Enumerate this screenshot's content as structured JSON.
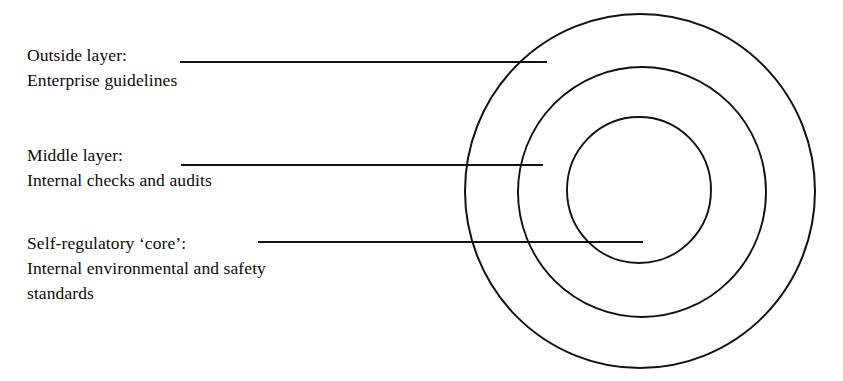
{
  "diagram": {
    "background_color": "#ffffff",
    "stroke_color": "#111111",
    "center": {
      "x": 640,
      "y": 191
    },
    "rings": [
      {
        "name": "outer-ring",
        "radius_x": 175,
        "radius_y": 177,
        "stroke_width": 2.0,
        "layer_label": "Outside layer"
      },
      {
        "name": "middle-ring",
        "radius_x": 124,
        "radius_y": 125,
        "stroke_width": 1.9,
        "layer_label": "Middle layer"
      },
      {
        "name": "inner-ring",
        "radius_x": 72,
        "radius_y": 73,
        "stroke_width": 1.9,
        "layer_label": "Self-regulatory core"
      }
    ],
    "leaders": [
      {
        "name": "leader-outer",
        "x1": 180,
        "y1": 62,
        "x2": 547,
        "y2": 62,
        "stroke_width": 2.0
      },
      {
        "name": "leader-middle",
        "x1": 181,
        "y1": 165,
        "x2": 543,
        "y2": 165,
        "stroke_width": 2.0
      },
      {
        "name": "leader-core",
        "x1": 258,
        "y1": 242,
        "x2": 643,
        "y2": 242,
        "stroke_width": 2.0
      }
    ],
    "callouts": {
      "outer": {
        "line1": "Outside layer:",
        "line2": "Enterprise guidelines"
      },
      "middle": {
        "line1": "Middle layer:",
        "line2": "Internal checks and audits"
      },
      "core": {
        "line1": "Self-regulatory ‘core’:",
        "line2": "Internal environmental and safety",
        "line3": "standards"
      }
    }
  }
}
